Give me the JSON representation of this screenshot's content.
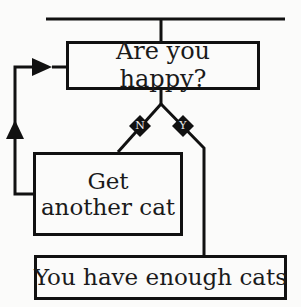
{
  "diagram": {
    "type": "flowchart",
    "nodes": {
      "question": {
        "label": "Are you happy?"
      },
      "action": {
        "label_line1": "Get",
        "label_line2": "another cat"
      },
      "result": {
        "label": "You have enough cats"
      }
    },
    "branches": {
      "no": {
        "label": "N",
        "target": "action"
      },
      "yes": {
        "label": "Y",
        "target": "result"
      }
    },
    "loop": {
      "from": "action",
      "to": "question"
    },
    "colors": {
      "line": "#111111",
      "background": "#fbfbfa",
      "diamond_fill": "#111111",
      "diamond_text": "#eeeeee"
    }
  }
}
